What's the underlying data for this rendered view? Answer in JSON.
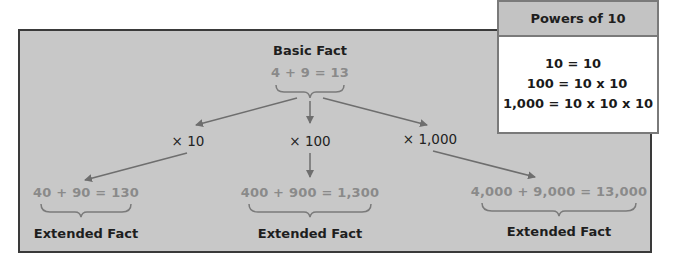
{
  "diagram": {
    "basic": {
      "title": "Basic Fact",
      "equation": "4 + 9 = 13"
    },
    "multipliers": [
      {
        "label": "× 10"
      },
      {
        "label": "× 100"
      },
      {
        "label": "× 1,000"
      }
    ],
    "extended": [
      {
        "equation": "40 + 90 = 130",
        "title": "Extended Fact"
      },
      {
        "equation": "400 + 900 = 1,300",
        "title": "Extended Fact"
      },
      {
        "equation": "4,000 + 9,000 = 13,000",
        "title": "Extended Fact"
      }
    ],
    "colors": {
      "panel_bg": "#c8c8c8",
      "equation_text": "#8a8a8a",
      "arrow": "#6e6e6e",
      "border": "#3a3a3a"
    }
  },
  "powers_of_10": {
    "title": "Powers of 10",
    "lines": [
      "10 = 10",
      "100 = 10 x 10",
      "1,000 = 10 x 10 x 10"
    ]
  }
}
